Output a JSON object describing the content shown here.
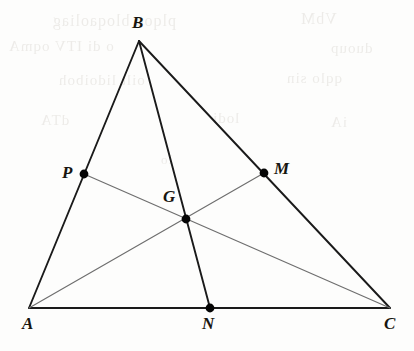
{
  "figure": {
    "width": 414,
    "height": 351,
    "background_color": "#fdfdfc"
  },
  "style": {
    "side_color": "#1a1a1a",
    "side_width": 1.9,
    "cevian_color": "#6e6e6e",
    "cevian_width": 1.15,
    "point_color": "#050505",
    "point_radius": 4.4,
    "label_color": "#17150f"
  },
  "points": [
    {
      "id": "A",
      "label": "A",
      "x": 29,
      "y": 308,
      "marked": false,
      "label_x": 22,
      "label_y": 315
    },
    {
      "id": "B",
      "label": "B",
      "x": 139,
      "y": 41,
      "marked": false,
      "label_x": 132,
      "label_y": 14
    },
    {
      "id": "C",
      "label": "C",
      "x": 390,
      "y": 308,
      "marked": false,
      "label_x": 384,
      "label_y": 315
    },
    {
      "id": "P",
      "label": "P",
      "x": 84,
      "y": 174,
      "marked": true,
      "label_x": 62,
      "label_y": 164
    },
    {
      "id": "M",
      "label": "M",
      "x": 264,
      "y": 173,
      "marked": true,
      "label_x": 274,
      "label_y": 160
    },
    {
      "id": "N",
      "label": "N",
      "x": 210,
      "y": 308,
      "marked": true,
      "label_x": 202,
      "label_y": 315
    },
    {
      "id": "G",
      "label": "G",
      "x": 186,
      "y": 219,
      "marked": true,
      "label_x": 163,
      "label_y": 188
    }
  ],
  "segments": [
    {
      "id": "side-AB",
      "from": "A",
      "to": "B",
      "kind": "side"
    },
    {
      "id": "side-BC",
      "from": "B",
      "to": "C",
      "kind": "side"
    },
    {
      "id": "side-AC",
      "from": "A",
      "to": "C",
      "kind": "side"
    },
    {
      "id": "median-BN",
      "from": "B",
      "to": "N",
      "kind": "side"
    },
    {
      "id": "median-AM",
      "from": "A",
      "to": "M",
      "kind": "cevian"
    },
    {
      "id": "median-PC",
      "from": "P",
      "to": "C",
      "kind": "cevian"
    }
  ],
  "ghost_text": [
    {
      "text": "plqoo bloqaoliag",
      "x": 52,
      "y": 12,
      "size": 16
    },
    {
      "text": "VbM",
      "x": 300,
      "y": 10,
      "size": 16
    },
    {
      "text": "o di ITV oqmA",
      "x": 8,
      "y": 38,
      "size": 15
    },
    {
      "text": "duoup",
      "x": 330,
      "y": 40,
      "size": 15
    },
    {
      "text": "oilt  lidoiboh",
      "x": 58,
      "y": 72,
      "size": 15
    },
    {
      "text": "qqlo  sin",
      "x": 286,
      "y": 70,
      "size": 15
    },
    {
      "text": "dTA",
      "x": 40,
      "y": 112,
      "size": 15
    },
    {
      "text": "lodi",
      "x": 212,
      "y": 110,
      "size": 15
    },
    {
      "text": "iA",
      "x": 330,
      "y": 114,
      "size": 15
    },
    {
      "text": "lo",
      "x": 160,
      "y": 152,
      "size": 13
    }
  ]
}
